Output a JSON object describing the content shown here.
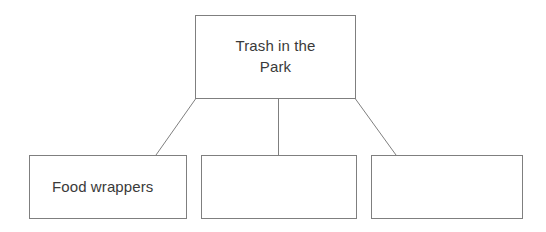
{
  "diagram": {
    "type": "hierarchy-tree",
    "title": "Trash in the Park",
    "background_color": "#ffffff",
    "border_color": "#7f7f7f",
    "text_color": "#3a3a3a",
    "root": {
      "label": "Trash in the\nPark"
    },
    "children": [
      {
        "label": "Food wrappers"
      },
      {
        "label": ""
      },
      {
        "label": ""
      }
    ],
    "connectors": [
      {
        "name": "root-to-child-1",
        "from": "root-bottom-left",
        "to": "child-1-top-right",
        "style": "diagonal"
      },
      {
        "name": "root-to-child-2",
        "from": "root-bottom-center",
        "to": "child-2-top-center",
        "style": "vertical"
      },
      {
        "name": "root-to-child-3",
        "from": "root-bottom-right",
        "to": "child-3-top-left",
        "style": "diagonal"
      }
    ]
  }
}
